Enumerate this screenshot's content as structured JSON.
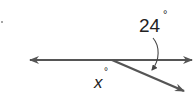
{
  "diagram": {
    "type": "geometry-angles",
    "labels": {
      "given_angle": "24",
      "unknown_angle": "x",
      "degree_symbol": "°"
    },
    "colors": {
      "line": "#555555",
      "text": "#222222",
      "background": "#ffffff"
    }
  }
}
